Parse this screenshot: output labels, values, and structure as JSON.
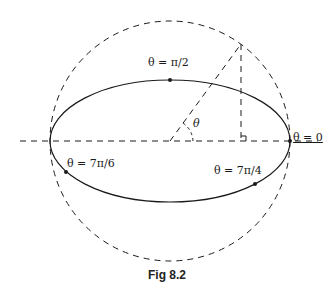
{
  "figure": {
    "caption": "Fig 8.2",
    "labels": {
      "theta_pi_2": "θ = π/2",
      "theta_0": "θ = 0",
      "theta_7pi_6": "θ = 7π/6",
      "theta_7pi_4": "θ = 7π/4",
      "angle": "θ"
    },
    "colors": {
      "stroke": "#1a1a1a",
      "background": "#ffffff"
    }
  }
}
